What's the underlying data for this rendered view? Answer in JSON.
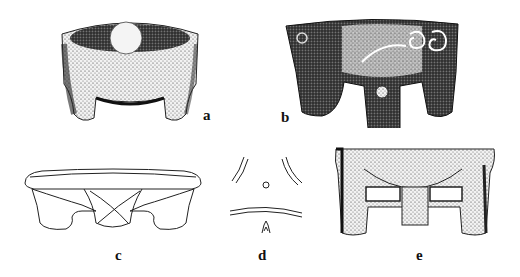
{
  "figure": {
    "panels": [
      {
        "id": "a",
        "label": "a",
        "description": "Stippled drawing of a three-legged stone mortar with a round pestle inside"
      },
      {
        "id": "b",
        "label": "b",
        "description": "Stippled drawing of a carved tripod mortar with spiral and face motifs"
      },
      {
        "id": "c",
        "label": "c",
        "description": "Outline line drawing of a tripod mortar with crossed lines on front leg"
      },
      {
        "id": "d",
        "label": "d",
        "description": "Schematic top/bottom view with three curved line pairs, small circle and motif"
      },
      {
        "id": "e",
        "label": "e",
        "description": "Stippled drawing of a rectangular footed stone mortar with openings between legs"
      }
    ]
  }
}
